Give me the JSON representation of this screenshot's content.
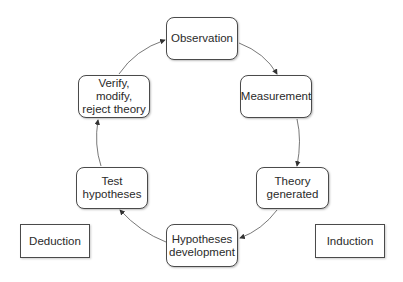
{
  "diagram": {
    "type": "cycle",
    "nodes": [
      {
        "id": "observation",
        "label": "Observation"
      },
      {
        "id": "measurement",
        "label": "Measurement"
      },
      {
        "id": "theory_generated",
        "label": "Theory\ngenerated"
      },
      {
        "id": "hypotheses_development",
        "label": "Hypotheses\ndevelopment"
      },
      {
        "id": "test_hypotheses",
        "label": "Test\nhypotheses"
      },
      {
        "id": "verify",
        "label": "Verify, modify,\nreject theory"
      }
    ],
    "side_labels": {
      "deduction": "Deduction",
      "induction": "Induction"
    },
    "edges": [
      {
        "from": "observation",
        "to": "measurement"
      },
      {
        "from": "measurement",
        "to": "theory_generated"
      },
      {
        "from": "theory_generated",
        "to": "hypotheses_development"
      },
      {
        "from": "hypotheses_development",
        "to": "test_hypotheses"
      },
      {
        "from": "test_hypotheses",
        "to": "verify"
      },
      {
        "from": "verify",
        "to": "observation"
      }
    ],
    "colors": {
      "stroke": "#4a4a4a",
      "text": "#2a2a2a",
      "background": "#ffffff"
    }
  }
}
